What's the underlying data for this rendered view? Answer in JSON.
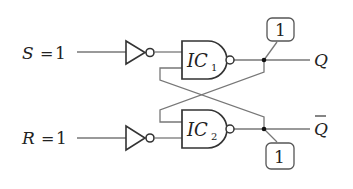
{
  "inputs": {
    "s": {
      "name": "S",
      "eq": "=",
      "value": "1"
    },
    "r": {
      "name": "R",
      "eq": "=",
      "value": "1"
    }
  },
  "gates": {
    "ic1": {
      "name": "IC",
      "sub": "1"
    },
    "ic2": {
      "name": "IC",
      "sub": "2"
    }
  },
  "outputs": {
    "q": {
      "name": "Q"
    },
    "qbar": {
      "name": "Q",
      "overbar": true
    }
  },
  "callouts": {
    "top": {
      "value": "1"
    },
    "bottom": {
      "value": "1"
    }
  },
  "colors": {
    "wire": "#777777",
    "gate_stroke": "#333333",
    "text": "#222222"
  }
}
